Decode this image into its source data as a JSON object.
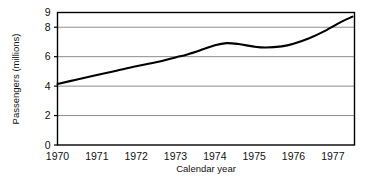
{
  "chart_data": {
    "type": "line",
    "title": "",
    "xlabel": "Calendar year",
    "ylabel": "Passengers (millions)",
    "xlim": [
      1970,
      1977.55
    ],
    "ylim": [
      0,
      9
    ],
    "grid": true,
    "grid_axis": "y",
    "legend": "none",
    "xticks": [
      1970,
      1971,
      1972,
      1973,
      1974,
      1975,
      1976,
      1977
    ],
    "xtick_labels": [
      "1970",
      "1971",
      "1972",
      "1973",
      "1974",
      "1975",
      "1976",
      "1977"
    ],
    "yticks": [
      0,
      2,
      4,
      6,
      8,
      9
    ],
    "ytick_labels": [
      "0",
      "2",
      "4",
      "6",
      "8",
      "9"
    ],
    "series": [
      {
        "name": "Passengers",
        "color": "#000000",
        "x": [
          1970.0,
          1970.5,
          1971.0,
          1971.5,
          1972.0,
          1972.5,
          1973.0,
          1973.3,
          1973.7,
          1974.0,
          1974.3,
          1974.6,
          1975.0,
          1975.3,
          1975.7,
          1976.0,
          1976.4,
          1976.8,
          1977.2,
          1977.5
        ],
        "y": [
          4.15,
          4.45,
          4.75,
          5.05,
          5.35,
          5.62,
          5.95,
          6.15,
          6.5,
          6.78,
          6.92,
          6.86,
          6.68,
          6.62,
          6.7,
          6.88,
          7.25,
          7.75,
          8.35,
          8.72
        ]
      }
    ],
    "annotations": []
  },
  "figure": {
    "background_color": "#ffffff",
    "frame_color": "#000000",
    "grid_color": "#8c8c8c",
    "line_color": "#000000"
  }
}
